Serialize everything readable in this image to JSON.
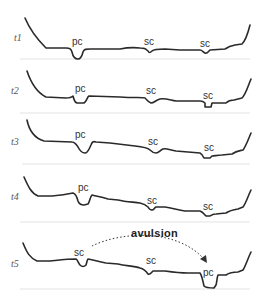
{
  "figure": {
    "rows": [
      {
        "time_label": "t1",
        "channels": [
          {
            "label": "pc",
            "type": "primary channel"
          },
          {
            "label": "sc",
            "type": "secondary channel"
          },
          {
            "label": "sc",
            "type": "secondary channel"
          }
        ]
      },
      {
        "time_label": "t2",
        "channels": [
          {
            "label": "pc",
            "type": "primary channel"
          },
          {
            "label": "sc",
            "type": "secondary channel"
          },
          {
            "label": "sc",
            "type": "secondary channel"
          }
        ]
      },
      {
        "time_label": "t3",
        "channels": [
          {
            "label": "pc",
            "type": "primary channel"
          },
          {
            "label": "sc",
            "type": "secondary channel"
          },
          {
            "label": "sc",
            "type": "secondary channel"
          }
        ]
      },
      {
        "time_label": "t4",
        "channels": [
          {
            "label": "pc",
            "type": "primary channel"
          },
          {
            "label": "sc",
            "type": "secondary channel"
          },
          {
            "label": "sc",
            "type": "secondary channel"
          }
        ]
      },
      {
        "time_label": "t5",
        "channels": [
          {
            "label": "sc",
            "type": "secondary channel"
          },
          {
            "label": "sc",
            "type": "secondary channel"
          },
          {
            "label": "pc",
            "type": "primary channel"
          }
        ]
      }
    ],
    "annotation": {
      "label": "avulsion",
      "from": "t5 left channel",
      "to": "t5 right channel",
      "style": "dotted arrow"
    },
    "colors": {
      "profile": "#2a2a2a",
      "baseline": "#e3e3e3",
      "time_label": "#555555"
    }
  }
}
